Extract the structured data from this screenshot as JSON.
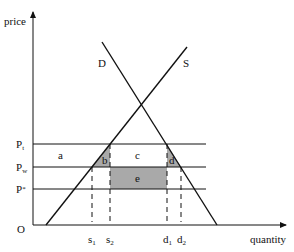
{
  "diagram": {
    "axes": {
      "y_label": "price",
      "x_label": "quantity",
      "origin_label": "O"
    },
    "curves": {
      "demand_label": "D",
      "supply_label": "S"
    },
    "price_levels": [
      {
        "id": "pt",
        "label": "P",
        "sub": "t"
      },
      {
        "id": "pw",
        "label": "P",
        "sub": "w"
      },
      {
        "id": "pstar",
        "label": "P",
        "sub": "*"
      }
    ],
    "quantity_marks": [
      {
        "id": "s1",
        "label": "s",
        "sub": "1"
      },
      {
        "id": "s2",
        "label": "s",
        "sub": "2"
      },
      {
        "id": "d1",
        "label": "d",
        "sub": "1"
      },
      {
        "id": "d2",
        "label": "d",
        "sub": "2"
      }
    ],
    "regions": {
      "a": "a",
      "b": "b",
      "c": "c",
      "d": "d",
      "e": "e"
    },
    "colors": {
      "shade": "#a9a9a9",
      "line": "#111111"
    }
  }
}
